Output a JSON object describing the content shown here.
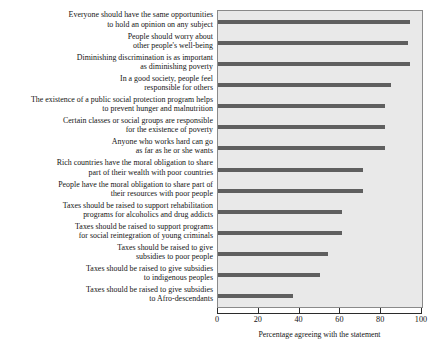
{
  "chart_data": {
    "type": "bar",
    "orientation": "horizontal",
    "title": "",
    "xlabel": "Percentage agreeing with the statement",
    "ylabel": "",
    "xlim": [
      0,
      100
    ],
    "xticks": [
      0,
      20,
      40,
      60,
      80,
      100
    ],
    "grid": false,
    "legend": null,
    "bar_color": "#5f5f5f",
    "plot_background": "#e9e9e9",
    "categories": [
      "Everyone should have the same opportunities\nto hold an opinion on any subject",
      "People should worry about\nother people's well-being",
      "Diminishing discrimination is as important\nas diminishing poverty",
      "In a good society, people feel\nresponsible for others",
      "The existence of a public social protection program helps\nto prevent hunger and malnutrition",
      "Certain classes or social groups are responsible\nfor the existence of poverty",
      "Anyone who works hard can go\nas far as he or she wants",
      "Rich countries have the moral obligation to share\npart of their wealth with poor countries",
      "People have the moral obligation to share part of\ntheir resources with poor people",
      "Taxes should be raised to support rehabilitation\nprograms for alcoholics and drug addicts",
      "Taxes should be raised to support programs\nfor social reintegration of young criminals",
      "Taxes should be raised to give\nsubsidies to poor people",
      "Taxes should be raised to give subsidies\nto indigenous peoples",
      "Taxes should be raised to give subsidies\nto Afro-descendants"
    ],
    "values": [
      94,
      93,
      94,
      85,
      82,
      82,
      82,
      71,
      71,
      61,
      61,
      54,
      50,
      37
    ]
  }
}
